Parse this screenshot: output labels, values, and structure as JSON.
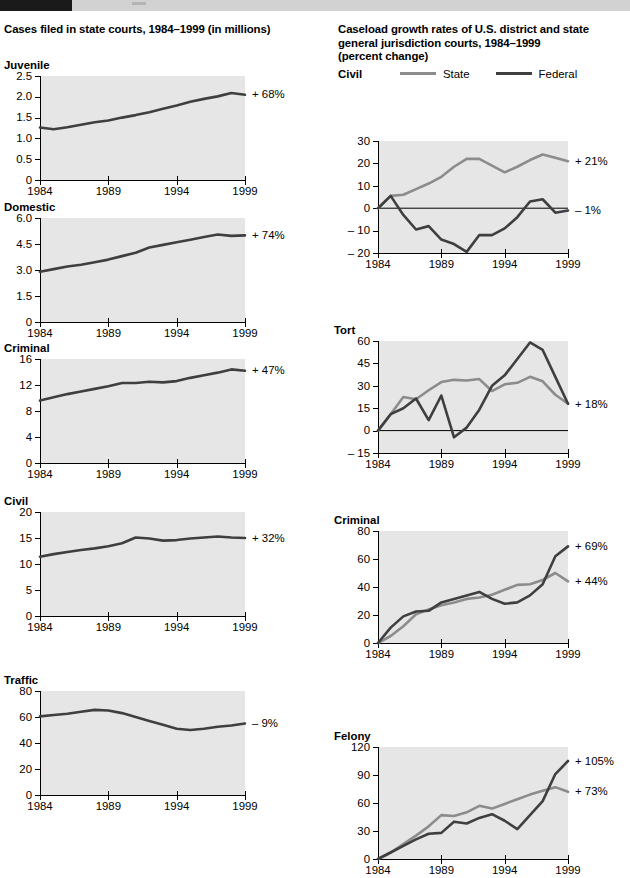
{
  "banner": {
    "present": true
  },
  "left": {
    "title": "Cases filed in state courts, 1984–1999 (in millions)"
  },
  "right": {
    "title_line1": "Caseload growth rates of U.S. district and state",
    "title_line2": "general jurisdiction courts, 1984–1999",
    "title_line3": "(percent change)",
    "legend": {
      "chart_name": "Civil",
      "state_label": "State",
      "federal_label": "Federal",
      "state_color": "#8c8c8c",
      "federal_color": "#3f3f3f"
    }
  },
  "chart_data": [
    {
      "id": "left-juvenile",
      "type": "line",
      "title": "Juvenile",
      "panel": "Cases filed in state courts, 1984–1999 (in millions)",
      "xlabel": "",
      "ylabel": "",
      "xlim": [
        1984,
        1999
      ],
      "ylim": [
        0,
        2.5
      ],
      "yticks": [
        0,
        0.5,
        1.0,
        1.5,
        2.0,
        2.5
      ],
      "yticklabels": [
        "0",
        "0.5",
        "1.0",
        "1.5",
        "2.0",
        "2.5"
      ],
      "xticks": [
        1984,
        1989,
        1994,
        1999
      ],
      "xticklabels": [
        "1984",
        "1989",
        "1994",
        "1999"
      ],
      "grid": false,
      "annotation": "+ 68%",
      "annotation_value": 2.05,
      "series": [
        {
          "name": "State",
          "color": "#3f3f3f",
          "x": [
            1984,
            1985,
            1986,
            1987,
            1988,
            1989,
            1990,
            1991,
            1992,
            1993,
            1994,
            1995,
            1996,
            1997,
            1998,
            1999
          ],
          "values": [
            1.26,
            1.22,
            1.27,
            1.33,
            1.39,
            1.43,
            1.5,
            1.56,
            1.63,
            1.71,
            1.79,
            1.88,
            1.95,
            2.01,
            2.09,
            2.05
          ]
        }
      ]
    },
    {
      "id": "left-domestic",
      "type": "line",
      "title": "Domestic",
      "panel": "Cases filed in state courts, 1984–1999 (in millions)",
      "xlim": [
        1984,
        1999
      ],
      "ylim": [
        0,
        6.0
      ],
      "yticks": [
        0,
        1.5,
        3.0,
        4.5,
        6.0
      ],
      "yticklabels": [
        "0",
        "1.5",
        "3.0",
        "4.5",
        "6.0"
      ],
      "xticks": [
        1984,
        1989,
        1994,
        1999
      ],
      "xticklabels": [
        "1984",
        "1989",
        "1994",
        "1999"
      ],
      "grid": false,
      "annotation": "+ 74%",
      "annotation_value": 5.0,
      "series": [
        {
          "name": "State",
          "color": "#3f3f3f",
          "x": [
            1984,
            1985,
            1986,
            1987,
            1988,
            1989,
            1990,
            1991,
            1992,
            1993,
            1994,
            1995,
            1996,
            1997,
            1998,
            1999
          ],
          "values": [
            2.9,
            3.05,
            3.2,
            3.3,
            3.45,
            3.6,
            3.8,
            4.0,
            4.3,
            4.45,
            4.6,
            4.75,
            4.9,
            5.05,
            4.97,
            5.0
          ]
        }
      ]
    },
    {
      "id": "left-criminal",
      "type": "line",
      "title": "Criminal",
      "panel": "Cases filed in state courts, 1984–1999 (in millions)",
      "xlim": [
        1984,
        1999
      ],
      "ylim": [
        0,
        16
      ],
      "yticks": [
        0,
        4,
        8,
        12,
        16
      ],
      "yticklabels": [
        "0",
        "4",
        "8",
        "12",
        "16"
      ],
      "xticks": [
        1984,
        1989,
        1994,
        1999
      ],
      "xticklabels": [
        "1984",
        "1989",
        "1994",
        "1999"
      ],
      "grid": false,
      "annotation": "+ 47%",
      "annotation_value": 14.2,
      "series": [
        {
          "name": "State",
          "color": "#3f3f3f",
          "x": [
            1984,
            1985,
            1986,
            1987,
            1988,
            1989,
            1990,
            1991,
            1992,
            1993,
            1994,
            1995,
            1996,
            1997,
            1998,
            1999
          ],
          "values": [
            9.6,
            10.1,
            10.6,
            11.0,
            11.4,
            11.8,
            12.3,
            12.3,
            12.5,
            12.4,
            12.6,
            13.1,
            13.5,
            13.9,
            14.4,
            14.2
          ]
        }
      ]
    },
    {
      "id": "left-civil",
      "type": "line",
      "title": "Civil",
      "panel": "Cases filed in state courts, 1984–1999 (in millions)",
      "xlim": [
        1984,
        1999
      ],
      "ylim": [
        0,
        20
      ],
      "yticks": [
        0,
        5,
        10,
        15,
        20
      ],
      "yticklabels": [
        "0",
        "5",
        "10",
        "15",
        "20"
      ],
      "xticks": [
        1984,
        1989,
        1994,
        1999
      ],
      "xticklabels": [
        "1984",
        "1989",
        "1994",
        "1999"
      ],
      "grid": false,
      "annotation": "+ 32%",
      "annotation_value": 15.0,
      "series": [
        {
          "name": "State",
          "color": "#3f3f3f",
          "x": [
            1984,
            1985,
            1986,
            1987,
            1988,
            1989,
            1990,
            1991,
            1992,
            1993,
            1994,
            1995,
            1996,
            1997,
            1998,
            1999
          ],
          "values": [
            11.4,
            11.9,
            12.3,
            12.7,
            13.0,
            13.4,
            14.0,
            15.1,
            14.9,
            14.5,
            14.6,
            14.9,
            15.1,
            15.3,
            15.1,
            15.0
          ]
        }
      ]
    },
    {
      "id": "left-traffic",
      "type": "line",
      "title": "Traffic",
      "panel": "Cases filed in state courts, 1984–1999 (in millions)",
      "xlim": [
        1984,
        1999
      ],
      "ylim": [
        0,
        80
      ],
      "yticks": [
        0,
        20,
        40,
        60,
        80
      ],
      "yticklabels": [
        "0",
        "20",
        "40",
        "60",
        "80"
      ],
      "xticks": [
        1984,
        1989,
        1994,
        1999
      ],
      "xticklabels": [
        "1984",
        "1989",
        "1994",
        "1999"
      ],
      "grid": false,
      "annotation": "– 9%",
      "annotation_value": 55,
      "series": [
        {
          "name": "State",
          "color": "#3f3f3f",
          "x": [
            1984,
            1985,
            1986,
            1987,
            1988,
            1989,
            1990,
            1991,
            1992,
            1993,
            1994,
            1995,
            1996,
            1997,
            1998,
            1999
          ],
          "values": [
            60.5,
            61.5,
            62.5,
            64.0,
            65.5,
            65.0,
            63.0,
            60.0,
            57.0,
            54.0,
            51.0,
            50.0,
            51.0,
            52.5,
            53.5,
            55.0
          ]
        }
      ]
    },
    {
      "id": "right-civil",
      "type": "line",
      "title": "Civil",
      "panel": "Caseload growth rates of U.S. district and state general jurisdiction courts, 1984–1999 (percent change)",
      "xlim": [
        1984,
        1999
      ],
      "ylim": [
        -20,
        30
      ],
      "yticks": [
        -20,
        -10,
        0,
        10,
        20,
        30
      ],
      "yticklabels": [
        "– 20",
        "– 10",
        "0",
        "10",
        "20",
        "30"
      ],
      "xticks": [
        1984,
        1989,
        1994,
        1999
      ],
      "xticklabels": [
        "1984",
        "1989",
        "1994",
        "1999"
      ],
      "grid": false,
      "zeroline": true,
      "annotations": [
        {
          "text": "+ 21%",
          "value": 21
        },
        {
          "text": "– 1%",
          "value": -1
        }
      ],
      "series": [
        {
          "name": "State",
          "color": "#8c8c8c",
          "x": [
            1984,
            1985,
            1986,
            1987,
            1988,
            1989,
            1990,
            1991,
            1992,
            1993,
            1994,
            1995,
            1996,
            1997,
            1998,
            1999
          ],
          "values": [
            0,
            5.5,
            6.0,
            8.5,
            11.0,
            14.0,
            18.5,
            22.0,
            22.0,
            19.0,
            16.0,
            18.5,
            21.5,
            24.0,
            22.5,
            21.0
          ]
        },
        {
          "name": "Federal",
          "color": "#3f3f3f",
          "x": [
            1984,
            1985,
            1986,
            1987,
            1988,
            1989,
            1990,
            1991,
            1992,
            1993,
            1994,
            1995,
            1996,
            1997,
            1998,
            1999
          ],
          "values": [
            0,
            5.5,
            -3.0,
            -9.5,
            -8.0,
            -14.0,
            -16.0,
            -19.5,
            -12.0,
            -12.0,
            -9.0,
            -4.0,
            3.0,
            4.0,
            -2.0,
            -1.0
          ]
        }
      ]
    },
    {
      "id": "right-tort",
      "type": "line",
      "title": "Tort",
      "panel": "Caseload growth rates of U.S. district and state general jurisdiction courts, 1984–1999 (percent change)",
      "xlim": [
        1984,
        1999
      ],
      "ylim": [
        -15,
        60
      ],
      "yticks": [
        -15,
        0,
        15,
        30,
        45,
        60
      ],
      "yticklabels": [
        "– 15",
        "0",
        "15",
        "30",
        "45",
        "60"
      ],
      "xticks": [
        1984,
        1989,
        1994,
        1999
      ],
      "xticklabels": [
        "1984",
        "1989",
        "1994",
        "1999"
      ],
      "grid": false,
      "zeroline": true,
      "annotations": [
        {
          "text": "+ 18%",
          "value": 18
        }
      ],
      "series": [
        {
          "name": "State",
          "color": "#8c8c8c",
          "x": [
            1984,
            1985,
            1986,
            1987,
            1988,
            1989,
            1990,
            1991,
            1992,
            1993,
            1994,
            1995,
            1996,
            1997,
            1998,
            1999
          ],
          "values": [
            0,
            11.0,
            22.5,
            21.0,
            27.0,
            32.5,
            34.0,
            33.5,
            34.5,
            26.5,
            31.0,
            32.0,
            36.0,
            33.0,
            24.0,
            18.0
          ]
        },
        {
          "name": "Federal",
          "color": "#3f3f3f",
          "x": [
            1984,
            1985,
            1986,
            1987,
            1988,
            1989,
            1990,
            1991,
            1992,
            1993,
            1994,
            1995,
            1996,
            1997,
            1998,
            1999
          ],
          "values": [
            0,
            11.0,
            15.0,
            21.5,
            7.0,
            23.5,
            -4.5,
            2.0,
            14.0,
            30.0,
            37.0,
            48.0,
            59.0,
            54.0,
            36.0,
            18.0
          ]
        }
      ]
    },
    {
      "id": "right-criminal",
      "type": "line",
      "title": "Criminal",
      "panel": "Caseload growth rates of U.S. district and state general jurisdiction courts, 1984–1999 (percent change)",
      "xlim": [
        1984,
        1999
      ],
      "ylim": [
        0,
        80
      ],
      "yticks": [
        0,
        20,
        40,
        60,
        80
      ],
      "yticklabels": [
        "0",
        "20",
        "40",
        "60",
        "80"
      ],
      "xticks": [
        1984,
        1989,
        1994,
        1999
      ],
      "xticklabels": [
        "1984",
        "1989",
        "1994",
        "1999"
      ],
      "grid": false,
      "annotations": [
        {
          "text": "+ 69%",
          "value": 69
        },
        {
          "text": "+ 44%",
          "value": 44
        }
      ],
      "series": [
        {
          "name": "State",
          "color": "#8c8c8c",
          "x": [
            1984,
            1985,
            1986,
            1987,
            1988,
            1989,
            1990,
            1991,
            1992,
            1993,
            1994,
            1995,
            1996,
            1997,
            1998,
            1999
          ],
          "values": [
            0,
            5.0,
            12.0,
            20.5,
            24.0,
            27.0,
            29.0,
            31.5,
            32.5,
            34.5,
            38.0,
            41.5,
            42.0,
            45.0,
            50.0,
            44.0
          ]
        },
        {
          "name": "Federal",
          "color": "#3f3f3f",
          "x": [
            1984,
            1985,
            1986,
            1987,
            1988,
            1989,
            1990,
            1991,
            1992,
            1993,
            1994,
            1995,
            1996,
            1997,
            1998,
            1999
          ],
          "values": [
            0,
            11.0,
            19.0,
            22.5,
            23.0,
            29.0,
            31.5,
            34.0,
            36.5,
            31.5,
            28.0,
            29.0,
            34.0,
            42.0,
            62.0,
            69.0
          ]
        }
      ]
    },
    {
      "id": "right-felony",
      "type": "line",
      "title": "Felony",
      "panel": "Caseload growth rates of U.S. district and state general jurisdiction courts, 1984–1999 (percent change)",
      "xlim": [
        1984,
        1999
      ],
      "ylim": [
        0,
        120
      ],
      "yticks": [
        0,
        30,
        60,
        90,
        120
      ],
      "yticklabels": [
        "0",
        "30",
        "60",
        "90",
        "120"
      ],
      "xticks": [
        1984,
        1989,
        1994,
        1999
      ],
      "xticklabels": [
        "1984",
        "1989",
        "1994",
        "1999"
      ],
      "grid": false,
      "annotations": [
        {
          "text": "+ 105%",
          "value": 105
        },
        {
          "text": "+ 73%",
          "value": 73
        }
      ],
      "series": [
        {
          "name": "State",
          "color": "#8c8c8c",
          "x": [
            1984,
            1985,
            1986,
            1987,
            1988,
            1989,
            1990,
            1991,
            1992,
            1993,
            1994,
            1995,
            1996,
            1997,
            1998,
            1999
          ],
          "values": [
            0,
            7.0,
            16.0,
            25.0,
            35.0,
            47.0,
            46.0,
            50.0,
            57.0,
            54.0,
            59.0,
            64.0,
            69.0,
            73.0,
            77.0,
            72.0
          ]
        },
        {
          "name": "Federal",
          "color": "#3f3f3f",
          "x": [
            1984,
            1985,
            1986,
            1987,
            1988,
            1989,
            1990,
            1991,
            1992,
            1993,
            1994,
            1995,
            1996,
            1997,
            1998,
            1999
          ],
          "values": [
            0,
            7.0,
            14.0,
            21.0,
            27.0,
            28.0,
            40.0,
            38.0,
            44.0,
            48.0,
            41.0,
            32.0,
            47.0,
            62.0,
            91.0,
            105.0
          ]
        }
      ]
    }
  ]
}
